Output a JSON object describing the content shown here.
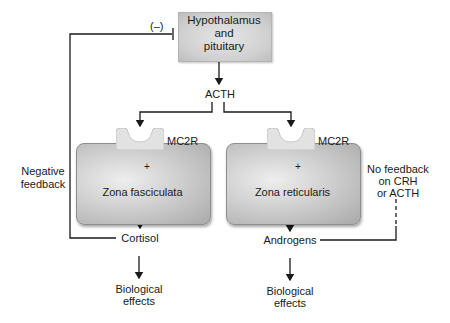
{
  "diagram": {
    "type": "flowchart",
    "nodes": {
      "hypothalamus": {
        "label_line1": "Hypothalamus",
        "label_line2": "and",
        "label_line3": "pituitary"
      },
      "acth": {
        "label": "ACTH"
      },
      "receptor_left": {
        "label": "MC2R"
      },
      "receptor_right": {
        "label": "MC2R"
      },
      "zona_fasciculata": {
        "label": "Zona fasciculata",
        "sign": "+"
      },
      "zona_reticularis": {
        "label": "Zona reticularis",
        "sign": "+"
      },
      "cortisol": {
        "label": "Cortisol"
      },
      "androgens": {
        "label": "Androgens"
      },
      "bio_left": {
        "label_line1": "Biological",
        "label_line2": "effects"
      },
      "bio_right": {
        "label_line1": "Biological",
        "label_line2": "effects"
      }
    },
    "annotations": {
      "inhibition_sign": "(–)",
      "negative_feedback_line1": "Negative",
      "negative_feedback_line2": "feedback",
      "no_feedback_line1": "No feedback",
      "no_feedback_line2": "on CRH",
      "no_feedback_line3": "or ACTH"
    },
    "edges": [
      {
        "from": "Hypothalamus and pituitary",
        "to": "ACTH",
        "type": "arrow"
      },
      {
        "from": "ACTH",
        "to": "MC2R (Zona fasciculata)",
        "type": "arrow"
      },
      {
        "from": "ACTH",
        "to": "MC2R (Zona reticularis)",
        "type": "arrow"
      },
      {
        "from": "MC2R",
        "to": "Zona fasciculata",
        "type": "stimulation",
        "sign": "+"
      },
      {
        "from": "MC2R",
        "to": "Zona reticularis",
        "type": "stimulation",
        "sign": "+"
      },
      {
        "from": "Zona fasciculata",
        "to": "Cortisol",
        "type": "arrow"
      },
      {
        "from": "Zona reticularis",
        "to": "Androgens",
        "type": "arrow"
      },
      {
        "from": "Cortisol",
        "to": "Biological effects",
        "type": "arrow"
      },
      {
        "from": "Androgens",
        "to": "Biological effects",
        "type": "arrow"
      },
      {
        "from": "Cortisol",
        "to": "Hypothalamus and pituitary",
        "type": "inhibition",
        "label": "Negative feedback"
      },
      {
        "from": "Androgens",
        "to": "CRH/ACTH",
        "type": "dashed",
        "label": "No feedback on CRH or ACTH"
      }
    ],
    "colors": {
      "line": "#1a1a1a",
      "box_fill": "#c9c9c9",
      "receptor_fill": "#e2e2e2",
      "background": "#ffffff"
    }
  }
}
